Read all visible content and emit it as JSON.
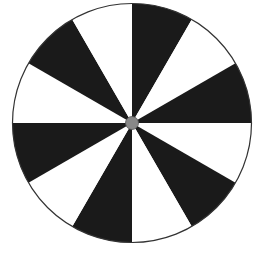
{
  "diagram": {
    "type": "spinner",
    "sector_count": 12,
    "sectors": [
      {
        "index": 1,
        "color": "#1a1a1a"
      },
      {
        "index": 2,
        "color": "#ffffff"
      },
      {
        "index": 3,
        "color": "#1a1a1a"
      },
      {
        "index": 4,
        "color": "#ffffff"
      },
      {
        "index": 5,
        "color": "#1a1a1a"
      },
      {
        "index": 6,
        "color": "#ffffff"
      },
      {
        "index": 7,
        "color": "#1a1a1a"
      },
      {
        "index": 8,
        "color": "#ffffff"
      },
      {
        "index": 9,
        "color": "#1a1a1a"
      },
      {
        "index": 10,
        "color": "#ffffff"
      },
      {
        "index": 11,
        "color": "#1a1a1a"
      },
      {
        "index": 12,
        "color": "#ffffff"
      }
    ],
    "outline_color": "#333333",
    "hub_color": "#888888"
  }
}
